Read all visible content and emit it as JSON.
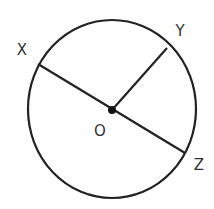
{
  "diagram": {
    "type": "circle-geometry",
    "circle": {
      "cx": 112,
      "cy": 109,
      "rx": 84,
      "ry": 89,
      "color": "#222222",
      "stroke_width": 2.2
    },
    "center": {
      "label": "O",
      "x": 112,
      "y": 110,
      "label_x": 100,
      "label_y": 130
    },
    "points": [
      {
        "name": "X",
        "x": 38,
        "y": 64,
        "label_x": 22,
        "label_y": 50
      },
      {
        "name": "Y",
        "x": 167,
        "y": 48,
        "label_x": 180,
        "label_y": 31
      },
      {
        "name": "Z",
        "x": 185,
        "y": 153,
        "label_x": 199,
        "label_y": 165
      }
    ],
    "segments": [
      {
        "from": "X",
        "to": "Z",
        "description": "diameter XZ through O"
      },
      {
        "from": "O",
        "to": "Y",
        "description": "radius OY"
      }
    ]
  },
  "labels": {
    "x": "X",
    "y": "Y",
    "z": "Z",
    "o": "O"
  }
}
